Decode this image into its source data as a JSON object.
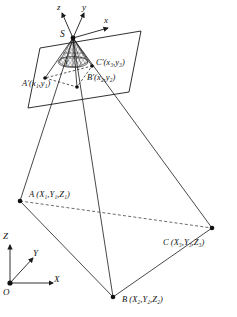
{
  "figure": {
    "type": "perspective-projection-diagram",
    "background_color": "#ffffff",
    "line_color": "#1a1a1a",
    "dashed_color": "#555555"
  },
  "perspective_center": {
    "label": "S",
    "x": 73,
    "y": 38
  },
  "image_axes": {
    "z_label": "z",
    "y_label": "y",
    "x_label": "x"
  },
  "field_angle": {
    "label": "γ"
  },
  "image_points": [
    {
      "name": "A-prime",
      "label": "A′",
      "coord_text": "(x₁,y₁)",
      "base": "A′",
      "sub_x": "1",
      "sub_y": "1"
    },
    {
      "name": "B-prime",
      "label": "B′",
      "coord_text": "(x₂,y₂)",
      "base": "B′",
      "sub_x": "2",
      "sub_y": "2"
    },
    {
      "name": "C-prime",
      "label": "C′",
      "coord_text": "(x₃,y₃)",
      "base": "C′",
      "sub_x": "3",
      "sub_y": "3"
    }
  ],
  "ground_points": [
    {
      "name": "A",
      "label": "A",
      "coord_text": "(X₁,Y₁,Z₁)",
      "sub": "1"
    },
    {
      "name": "B",
      "label": "B",
      "coord_text": "(X₂,Y₂,Z₂)",
      "sub": "2"
    },
    {
      "name": "C",
      "label": "C",
      "coord_text": "(X₃,Y₃,Z₃)",
      "sub": "3"
    }
  ],
  "object_frame": {
    "origin_label": "O",
    "x_label": "X",
    "y_label": "Y",
    "z_label": "Z"
  }
}
